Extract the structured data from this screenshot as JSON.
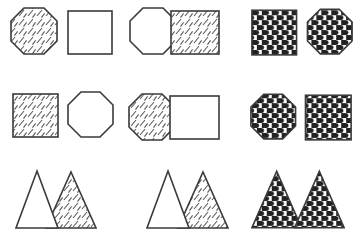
{
  "figure": {
    "width": 364,
    "height": 248,
    "background_color": "#ffffff",
    "stroke_color": "#3a3a3a",
    "hatch_color": "#5a5a5a",
    "checker_dark": "#222222",
    "checker_light": "#ffffff",
    "rows": 3,
    "columns": 3,
    "fill_types": [
      "plain",
      "diagonal-hatch",
      "checkered-dots"
    ],
    "shape_types": [
      "octagon",
      "square",
      "triangle"
    ]
  },
  "panels": [
    {
      "id": "panel-r1c1",
      "row": 1,
      "column": 1,
      "label": "octagon-hatched and square-plain, separated",
      "arrangement": "separated",
      "left": {
        "shape": "octagon",
        "fill": "diagonal-hatch"
      },
      "right": {
        "shape": "square",
        "fill": "plain"
      }
    },
    {
      "id": "panel-r1c2",
      "row": 1,
      "column": 2,
      "label": "octagon-plain and square-hatched, overlapping",
      "arrangement": "overlapping",
      "left": {
        "shape": "octagon",
        "fill": "plain"
      },
      "right": {
        "shape": "square",
        "fill": "diagonal-hatch"
      }
    },
    {
      "id": "panel-r1c3",
      "row": 1,
      "column": 3,
      "label": "square-checkered and octagon-checkered, separated",
      "arrangement": "separated",
      "left": {
        "shape": "square",
        "fill": "checkered-dots"
      },
      "right": {
        "shape": "octagon",
        "fill": "checkered-dots"
      }
    },
    {
      "id": "panel-r2c1",
      "row": 2,
      "column": 1,
      "label": "square-hatched and octagon-plain, separated",
      "arrangement": "separated",
      "left": {
        "shape": "square",
        "fill": "diagonal-hatch"
      },
      "right": {
        "shape": "octagon",
        "fill": "plain"
      }
    },
    {
      "id": "panel-r2c2",
      "row": 2,
      "column": 2,
      "label": "octagon-hatched and square-plain, overlapping",
      "arrangement": "overlapping",
      "left": {
        "shape": "octagon",
        "fill": "diagonal-hatch"
      },
      "right": {
        "shape": "square",
        "fill": "plain"
      }
    },
    {
      "id": "panel-r2c3",
      "row": 2,
      "column": 3,
      "label": "octagon-checkered and square-checkered, separated",
      "arrangement": "separated",
      "left": {
        "shape": "octagon",
        "fill": "checkered-dots"
      },
      "right": {
        "shape": "square",
        "fill": "checkered-dots"
      }
    },
    {
      "id": "panel-r3c1",
      "row": 3,
      "column": 1,
      "label": "triangle-plain and triangle-hatched, overlapping",
      "arrangement": "overlapping",
      "left": {
        "shape": "triangle",
        "fill": "plain"
      },
      "right": {
        "shape": "triangle",
        "fill": "diagonal-hatch"
      }
    },
    {
      "id": "panel-r3c2",
      "row": 3,
      "column": 2,
      "label": "triangle-plain and triangle-hatched, overlapping",
      "arrangement": "overlapping",
      "left": {
        "shape": "triangle",
        "fill": "plain"
      },
      "right": {
        "shape": "triangle",
        "fill": "diagonal-hatch"
      }
    },
    {
      "id": "panel-r3c3",
      "row": 3,
      "column": 3,
      "label": "triangle-checkered and triangle-checkered, adjacent",
      "arrangement": "adjacent",
      "left": {
        "shape": "triangle",
        "fill": "checkered-dots"
      },
      "right": {
        "shape": "triangle",
        "fill": "checkered-dots"
      }
    }
  ]
}
